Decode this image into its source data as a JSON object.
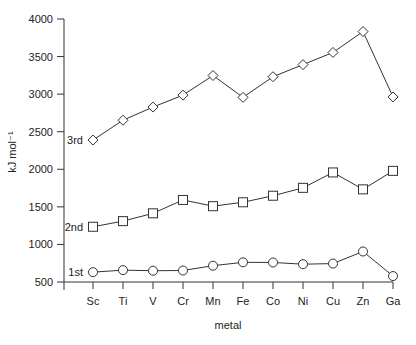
{
  "chart_data": {
    "type": "line",
    "title": "",
    "xlabel": "metal",
    "ylabel": "kJ mol⁻¹",
    "ylim": [
      500,
      4000
    ],
    "yticks": [
      500,
      1000,
      1500,
      2000,
      2500,
      3000,
      3500,
      4000
    ],
    "grid": false,
    "legend": "inline labels at left of each series",
    "categories": [
      "Sc",
      "Ti",
      "V",
      "Cr",
      "Mn",
      "Fe",
      "Co",
      "Ni",
      "Cu",
      "Zn",
      "Ga"
    ],
    "series": [
      {
        "name": "1st",
        "marker": "circle",
        "values": [
          631,
          658,
          650,
          653,
          717,
          762,
          760,
          737,
          745,
          906,
          579
        ]
      },
      {
        "name": "2nd",
        "marker": "square",
        "values": [
          1235,
          1310,
          1414,
          1592,
          1509,
          1561,
          1648,
          1753,
          1958,
          1733,
          1979
        ]
      },
      {
        "name": "3rd",
        "marker": "diamond",
        "values": [
          2389,
          2653,
          2828,
          2987,
          3248,
          2957,
          3232,
          3393,
          3555,
          3833,
          2963
        ]
      }
    ]
  },
  "colors": {
    "line": "#333333",
    "text": "#222222",
    "background": "#ffffff"
  }
}
